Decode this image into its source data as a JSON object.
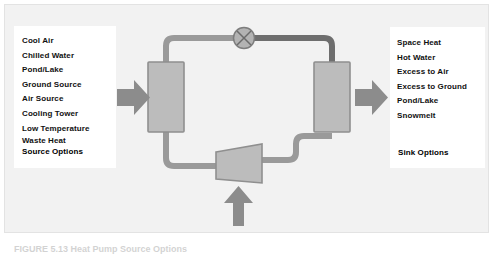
{
  "figure": {
    "caption": "FIGURE 5.13 Heat Pump Source Options",
    "background_color": "#f2f2f2",
    "border_color": "#e3e3e3"
  },
  "source_panel": {
    "title": "Source Options",
    "options": [
      "Cool Air",
      "Chilled Water",
      "Pond/Lake",
      "Ground Source",
      "Air Source",
      "Cooling Tower"
    ],
    "options_wrapped": [
      "Low Temperature",
      "Waste Heat"
    ]
  },
  "sink_panel": {
    "title": "Sink Options",
    "options": [
      "Space Heat",
      "Hot Water",
      "Excess to Air",
      "Excess to Ground",
      "Pond/Lake",
      "Snowmelt"
    ]
  },
  "diagram": {
    "components": [
      {
        "name": "evaporator-heat-exchanger",
        "type": "rectangle"
      },
      {
        "name": "condenser-heat-exchanger",
        "type": "rectangle"
      },
      {
        "name": "expansion-valve",
        "type": "circle-x"
      },
      {
        "name": "compressor",
        "type": "trapezoid"
      }
    ],
    "arrows": [
      {
        "name": "source-input-arrow",
        "direction": "right"
      },
      {
        "name": "sink-output-arrow",
        "direction": "right"
      },
      {
        "name": "compressor-power-arrow",
        "direction": "up"
      }
    ],
    "colors": {
      "shape_fill": "#b9b9b9",
      "shape_stroke": "#8a8a8a",
      "pipe_light": "#9a9a9a",
      "pipe_dark": "#6e6e6e",
      "arrow_fill": "#8c8c8c",
      "valve_fill": "#b0b0b0"
    }
  }
}
